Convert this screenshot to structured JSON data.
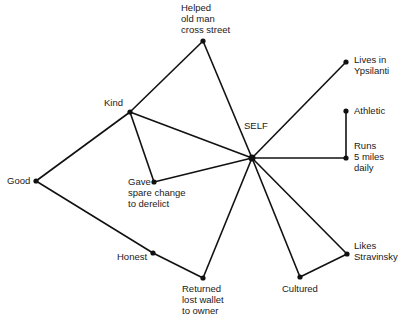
{
  "diagram": {
    "type": "semantic network",
    "colors": {
      "line": "#111111",
      "text": "#1a1a1a",
      "background": "#ffffff"
    },
    "nodes": [
      {
        "id": "self",
        "x": 252,
        "y": 158,
        "r": 3.5,
        "label_lines": [
          "SELF"
        ],
        "label_x": 244,
        "label_y": 129,
        "anchor": "start"
      },
      {
        "id": "helped",
        "x": 203,
        "y": 41,
        "r": 2.6,
        "label_lines": [
          "Helped",
          "old man",
          "cross street"
        ],
        "label_x": 181,
        "label_y": 11,
        "anchor": "start"
      },
      {
        "id": "lives",
        "x": 346,
        "y": 62,
        "r": 2.6,
        "label_lines": [
          "Lives in",
          "Ypsilanti"
        ],
        "label_x": 354,
        "label_y": 63,
        "anchor": "start"
      },
      {
        "id": "athletic",
        "x": 346,
        "y": 111,
        "r": 2.6,
        "label_lines": [
          "Athletic"
        ],
        "label_x": 354,
        "label_y": 114,
        "anchor": "start"
      },
      {
        "id": "runs",
        "x": 346,
        "y": 158,
        "r": 2.6,
        "label_lines": [
          "Runs",
          "5 miles",
          "daily"
        ],
        "label_x": 354,
        "label_y": 149,
        "anchor": "start"
      },
      {
        "id": "kind",
        "x": 130,
        "y": 112,
        "r": 2.6,
        "label_lines": [
          "Kind"
        ],
        "label_x": 104,
        "label_y": 106,
        "anchor": "start"
      },
      {
        "id": "gave",
        "x": 154,
        "y": 182,
        "r": 2.6,
        "label_lines": [
          "Gave",
          "spare change",
          "to derelict"
        ],
        "label_x": 128,
        "label_y": 185,
        "anchor": "start"
      },
      {
        "id": "good",
        "x": 36,
        "y": 181,
        "r": 2.6,
        "label_lines": [
          "Good"
        ],
        "label_x": 7,
        "label_y": 184,
        "anchor": "start"
      },
      {
        "id": "honest",
        "x": 153,
        "y": 253,
        "r": 2.6,
        "label_lines": [
          "Honest"
        ],
        "label_x": 117,
        "label_y": 260,
        "anchor": "start"
      },
      {
        "id": "returned",
        "x": 203,
        "y": 278,
        "r": 2.6,
        "label_lines": [
          "Returned",
          "lost wallet",
          "to owner"
        ],
        "label_x": 182,
        "label_y": 292,
        "anchor": "start"
      },
      {
        "id": "cultured",
        "x": 300,
        "y": 277,
        "r": 2.6,
        "label_lines": [
          "Cultured"
        ],
        "label_x": 282,
        "label_y": 292,
        "anchor": "start"
      },
      {
        "id": "likes",
        "x": 347,
        "y": 254,
        "r": 2.6,
        "label_lines": [
          "Likes",
          "Stravinsky"
        ],
        "label_x": 354,
        "label_y": 249,
        "anchor": "start"
      }
    ],
    "edges": [
      [
        "self",
        "helped"
      ],
      [
        "self",
        "lives"
      ],
      [
        "self",
        "runs"
      ],
      [
        "self",
        "kind"
      ],
      [
        "self",
        "gave"
      ],
      [
        "self",
        "returned"
      ],
      [
        "self",
        "cultured"
      ],
      [
        "self",
        "likes"
      ],
      [
        "helped",
        "kind"
      ],
      [
        "kind",
        "gave"
      ],
      [
        "kind",
        "good"
      ],
      [
        "good",
        "honest"
      ],
      [
        "honest",
        "returned"
      ],
      [
        "athletic",
        "runs"
      ],
      [
        "cultured",
        "likes"
      ]
    ]
  }
}
